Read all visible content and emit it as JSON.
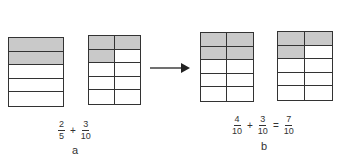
{
  "colors": {
    "shaded": "#c9c9c9",
    "line": "#333333",
    "background": "#ffffff"
  },
  "panels": [
    {
      "label": "a",
      "grids": [
        {
          "fraction": "2/5",
          "rows": 5,
          "cols": 1,
          "shaded": [
            [
              0,
              0
            ],
            [
              1,
              0
            ]
          ]
        },
        {
          "fraction": "3/10",
          "rows": 5,
          "cols": 2,
          "shaded": [
            [
              0,
              0
            ],
            [
              0,
              1
            ],
            [
              1,
              0
            ]
          ]
        }
      ],
      "equation": {
        "terms": [
          {
            "num": "2",
            "den": "5"
          },
          {
            "op": "+"
          },
          {
            "num": "3",
            "den": "10"
          }
        ]
      }
    },
    {
      "label": "b",
      "grids": [
        {
          "fraction": "4/10",
          "rows": 5,
          "cols": 2,
          "shaded": [
            [
              0,
              0
            ],
            [
              0,
              1
            ],
            [
              1,
              0
            ],
            [
              1,
              1
            ]
          ]
        },
        {
          "fraction": "3/10",
          "rows": 5,
          "cols": 2,
          "shaded": [
            [
              0,
              0
            ],
            [
              0,
              1
            ],
            [
              1,
              0
            ]
          ]
        }
      ],
      "equation": {
        "terms": [
          {
            "num": "4",
            "den": "10"
          },
          {
            "op": "+"
          },
          {
            "num": "3",
            "den": "10"
          },
          {
            "op": "="
          },
          {
            "num": "7",
            "den": "10"
          }
        ]
      }
    }
  ],
  "arrow": {
    "direction": "right"
  }
}
